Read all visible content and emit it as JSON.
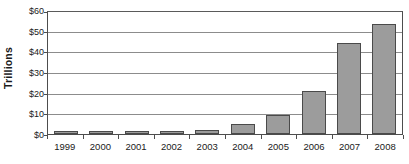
{
  "chart_data": {
    "type": "bar",
    "title": "",
    "xlabel": "",
    "ylabel": "Trillions",
    "categories": [
      "1999",
      "2000",
      "2001",
      "2002",
      "2003",
      "2004",
      "2005",
      "2006",
      "2007",
      "2008"
    ],
    "values": [
      1,
      1,
      1,
      1.5,
      2,
      5,
      9,
      21,
      44,
      53
    ],
    "ylim": [
      0,
      60
    ],
    "ytick_values": [
      0,
      10,
      20,
      30,
      40,
      50,
      60
    ],
    "ytick_labels": [
      "$0",
      "$10",
      "$20",
      "$30",
      "$40",
      "$50",
      "$60"
    ],
    "grid": true,
    "legend": false,
    "bar_color": "#9c9c9c",
    "bar_border_color": "#4a4a4a",
    "gridline_color": "#8c8c8c",
    "axis_color": "#4d4d4d",
    "background_color": "#ffffff"
  }
}
